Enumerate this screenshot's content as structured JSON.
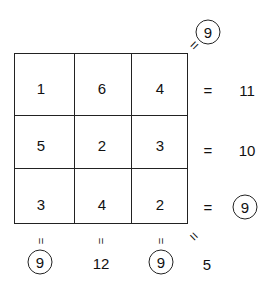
{
  "grid": {
    "cells": [
      [
        "1",
        "6",
        "4"
      ],
      [
        "5",
        "2",
        "3"
      ],
      [
        "3",
        "4",
        "2"
      ]
    ]
  },
  "row_sums": [
    {
      "value": "11",
      "circled": false
    },
    {
      "value": "10",
      "circled": false
    },
    {
      "value": "9",
      "circled": true
    }
  ],
  "col_sums": [
    {
      "value": "9",
      "circled": true
    },
    {
      "value": "12",
      "circled": false
    },
    {
      "value": "9",
      "circled": true
    }
  ],
  "diagonals": {
    "main": {
      "value": "5",
      "circled": false
    },
    "anti": {
      "value": "9",
      "circled": true
    }
  },
  "symbols": {
    "equals": "="
  }
}
